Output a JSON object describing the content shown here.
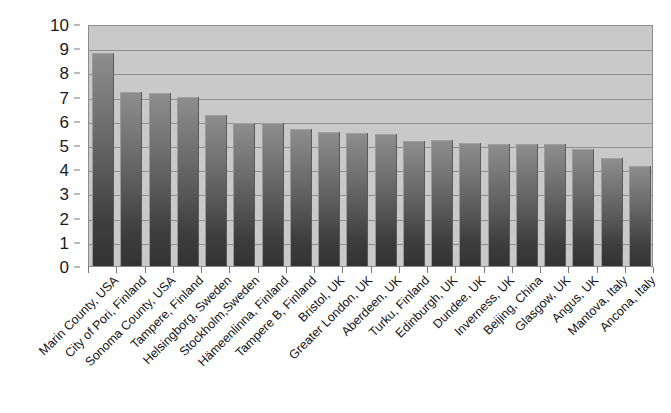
{
  "chart_data": {
    "type": "bar",
    "title": "",
    "subtitle": "",
    "xlabel": "",
    "ylabel": "",
    "ylim": [
      0,
      10
    ],
    "ytick_step": 1,
    "grid": true,
    "legend": false,
    "legend_position": "none",
    "orientation": "vertical",
    "ytick_labels": [
      "10",
      "9",
      "8",
      "7",
      "6",
      "5",
      "4",
      "3",
      "2",
      "1",
      "0"
    ],
    "categories": [
      "Marin County, USA",
      "City of Pori, Finland",
      "Sonoma County, USA",
      "Tampere, Finland",
      "Helsingborg, Sweden",
      "Stockholm,Sweden",
      "Hämeenlinna, Finland",
      "Tampere B, Finland",
      "Bristol, UK",
      "Greater London, UK",
      "Aberdeen, UK",
      "Turku, Finland",
      "Edinburgh, UK",
      "Dundee, UK",
      "Inverness, UK",
      "Beijing, China",
      "Glasgow, UK",
      "Angus, UK",
      "Mantova, Italy",
      "Ancona, Italy"
    ],
    "values": [
      8.8,
      7.2,
      7.15,
      7.0,
      6.25,
      5.9,
      5.9,
      5.65,
      5.55,
      5.5,
      5.45,
      5.15,
      5.2,
      5.1,
      5.05,
      5.05,
      5.05,
      4.85,
      4.45,
      4.15
    ],
    "series": [
      {
        "name": "",
        "values": [
          8.8,
          7.2,
          7.15,
          7.0,
          6.25,
          5.9,
          5.9,
          5.65,
          5.55,
          5.5,
          5.45,
          5.15,
          5.2,
          5.1,
          5.05,
          5.05,
          5.05,
          4.85,
          4.45,
          4.15
        ]
      }
    ]
  },
  "colors": {
    "plot_background": "#c9c9c9",
    "gridline": "#8e8e8e",
    "bar_top": "#8e8e8e",
    "bar_bottom": "#333333",
    "axis_text": "#1a1a1a",
    "page_background": "#ffffff"
  }
}
